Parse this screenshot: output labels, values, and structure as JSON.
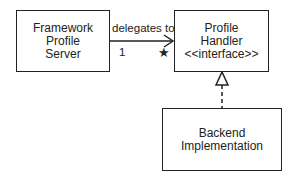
{
  "nodes": {
    "server": {
      "lines": [
        "Framework",
        "Profile",
        "Server"
      ]
    },
    "handler": {
      "lines": [
        "Profile",
        "Handler",
        "<<interface>>"
      ]
    },
    "backend": {
      "lines": [
        "Backend",
        "Implementation"
      ]
    }
  },
  "edges": {
    "delegation": {
      "label": "delegates to",
      "source_multiplicity": "1",
      "target_multiplicity": "★"
    },
    "realization": {
      "type": "dashed-hollow-triangle"
    }
  }
}
